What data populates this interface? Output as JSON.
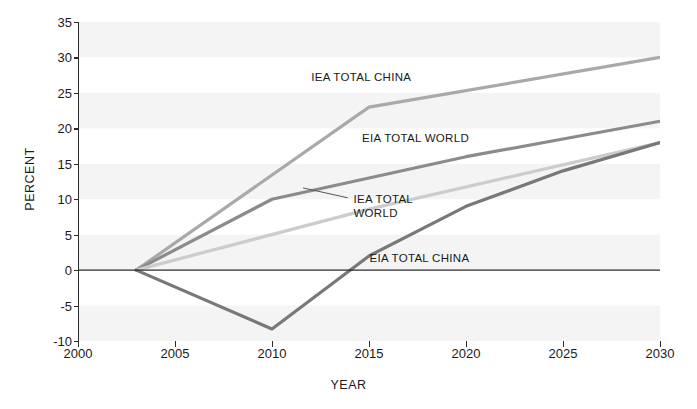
{
  "chart_data": {
    "type": "line",
    "title": "",
    "xlabel": "YEAR",
    "ylabel": "PERCENT",
    "xlim": [
      2000,
      2030
    ],
    "ylim": [
      -10,
      35
    ],
    "xticks": [
      2000,
      2005,
      2010,
      2015,
      2020,
      2025,
      2030
    ],
    "yticks": [
      35,
      30,
      25,
      20,
      15,
      10,
      5,
      0,
      -5,
      -10
    ],
    "grid": "alternating horizontal bands, every 5 percent",
    "legend": "inline series labels on plot",
    "zero_line": 0,
    "series": [
      {
        "name": "IEA TOTAL CHINA",
        "color": "#a9a9a9",
        "x": [
          2003,
          2015,
          2030
        ],
        "values": [
          0,
          23,
          30
        ]
      },
      {
        "name": "EIA TOTAL WORLD",
        "color": "#8b8b8b",
        "x": [
          2003,
          2010,
          2015,
          2020,
          2025,
          2030
        ],
        "values": [
          0,
          10,
          13,
          16,
          18.5,
          21
        ]
      },
      {
        "name": "IEA TOTAL WORLD",
        "color": "#cccccc",
        "x": [
          2003,
          2015,
          2030
        ],
        "values": [
          0,
          8.6,
          18
        ]
      },
      {
        "name": "EIA TOTAL CHINA",
        "color": "#787878",
        "x": [
          2003,
          2010,
          2015,
          2020,
          2025,
          2030
        ],
        "values": [
          0,
          -8.3,
          2,
          9,
          14,
          18
        ]
      }
    ],
    "annotations": [
      {
        "text": "IEA TOTAL CHINA",
        "x": 2014.6,
        "y": 27.2
      },
      {
        "text": "EIA TOTAL WORLD",
        "x": 2017.4,
        "y": 18.6
      },
      {
        "text": "IEA TOTAL WORLD",
        "x": 2014.2,
        "y": 10.0
      },
      {
        "text": "EIA TOTAL CHINA",
        "x": 2017.6,
        "y": 1.7
      }
    ]
  },
  "axis": {
    "ylabel": "PERCENT",
    "xlabel": "YEAR",
    "yticks": [
      "35",
      "30",
      "25",
      "20",
      "15",
      "10",
      "5",
      "0",
      "-5",
      "-10"
    ],
    "xticks": [
      "2000",
      "2005",
      "2010",
      "2015",
      "2020",
      "2025",
      "2030"
    ]
  },
  "labels": {
    "iea_china": "IEA TOTAL CHINA",
    "eia_world": "EIA TOTAL WORLD",
    "iea_world_line1": "IEA TOTAL",
    "iea_world_line2": "WORLD",
    "eia_china": "EIA TOTAL CHINA"
  },
  "colors": {
    "band": "#f4f4f4",
    "axis": "#2b2b2b",
    "iea_china": "#a9a9a9",
    "eia_world": "#8b8b8b",
    "iea_world": "#cccccc",
    "eia_china": "#787878"
  }
}
